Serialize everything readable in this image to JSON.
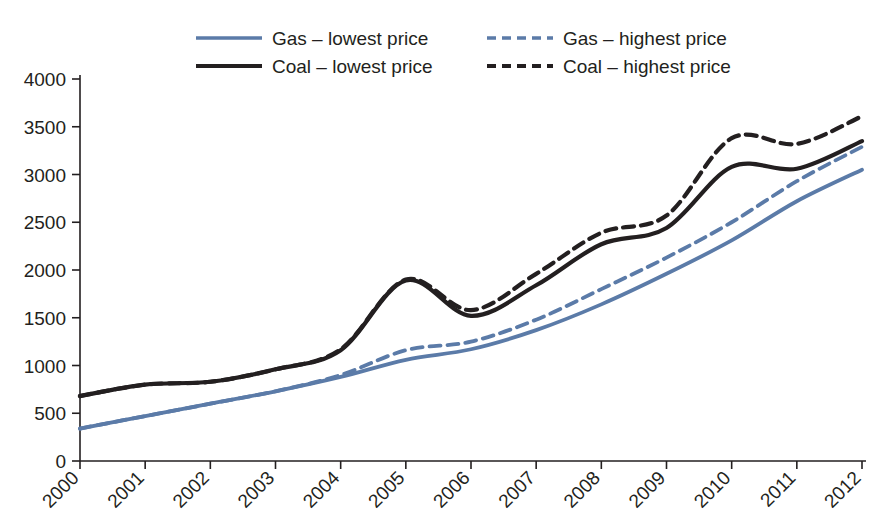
{
  "chart_data": {
    "type": "line",
    "title": "",
    "xlabel": "",
    "ylabel": "",
    "ylim": [
      0,
      4000
    ],
    "ytick_step": 500,
    "grid": false,
    "legend_position": "top",
    "categories": [
      "2000",
      "2001",
      "2002",
      "2003",
      "2004",
      "2005",
      "2006",
      "2007",
      "2008",
      "2009",
      "2010",
      "2011",
      "2012"
    ],
    "x": [
      2000,
      2001,
      2002,
      2003,
      2004,
      2005,
      2006,
      2007,
      2008,
      2009,
      2010,
      2011,
      2012
    ],
    "yticks": [
      0,
      500,
      1000,
      1500,
      2000,
      2500,
      3000,
      3500,
      4000
    ],
    "ytick_labels": [
      "0",
      "500",
      "1000",
      "1500",
      "2000",
      "2500",
      "3000",
      "3500",
      "4000"
    ],
    "series": [
      {
        "name": "Gas – lowest price",
        "key": "gas_lowest",
        "color": "#5B7BA8",
        "style": "solid",
        "values": [
          340,
          470,
          600,
          730,
          880,
          1060,
          1170,
          1370,
          1640,
          1960,
          2310,
          2720,
          3050
        ]
      },
      {
        "name": "Gas – highest price",
        "key": "gas_highest",
        "color": "#5B7BA8",
        "style": "dashed",
        "values": [
          340,
          470,
          600,
          730,
          900,
          1160,
          1250,
          1480,
          1800,
          2130,
          2500,
          2930,
          3290
        ]
      },
      {
        "name": "Coal – lowest price",
        "key": "coal_lowest",
        "color": "#231f20",
        "style": "solid",
        "values": [
          680,
          800,
          830,
          960,
          1160,
          1890,
          1520,
          1840,
          2270,
          2440,
          3080,
          3060,
          3350
        ]
      },
      {
        "name": "Coal – highest price",
        "key": "coal_highest",
        "color": "#231f20",
        "style": "dashed",
        "values": [
          680,
          800,
          830,
          960,
          1170,
          1900,
          1580,
          1960,
          2390,
          2570,
          3380,
          3320,
          3610
        ]
      }
    ]
  },
  "legend": {
    "items": [
      {
        "label": "Gas – lowest price",
        "color": "#5B7BA8",
        "style": "solid"
      },
      {
        "label": "Gas – highest price",
        "color": "#5B7BA8",
        "style": "dashed"
      },
      {
        "label": "Coal – lowest price",
        "color": "#231f20",
        "style": "solid"
      },
      {
        "label": "Coal – highest price",
        "color": "#231f20",
        "style": "dashed"
      }
    ]
  }
}
